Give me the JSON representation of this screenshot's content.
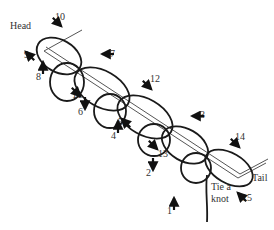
{
  "diagram": {
    "labels": {
      "head": "Head",
      "tail": "Tail",
      "tie_line1": "Tie a",
      "tie_line2": "knot"
    },
    "steps": [
      {
        "n": "1",
        "x": 167,
        "y": 214,
        "dir": "up"
      },
      {
        "n": "2",
        "x": 146,
        "y": 176,
        "dir": "down"
      },
      {
        "n": "3",
        "x": 200,
        "y": 118,
        "dir": "left"
      },
      {
        "n": "4",
        "x": 111,
        "y": 139,
        "dir": "up"
      },
      {
        "n": "5",
        "x": 118,
        "y": 125,
        "dir": "upleft"
      },
      {
        "n": "6",
        "x": 78,
        "y": 115,
        "dir": "down"
      },
      {
        "n": "7",
        "x": 110,
        "y": 57,
        "dir": "left"
      },
      {
        "n": "8",
        "x": 36,
        "y": 80,
        "dir": "up"
      },
      {
        "n": "9",
        "x": 24,
        "y": 58,
        "dir": "upleft"
      },
      {
        "n": "10",
        "x": 55,
        "y": 20,
        "dir": "downright"
      },
      {
        "n": "11",
        "x": 72,
        "y": 98,
        "dir": "downright"
      },
      {
        "n": "12",
        "x": 150,
        "y": 82,
        "dir": "downright"
      },
      {
        "n": "13",
        "x": 158,
        "y": 157,
        "dir": "downright"
      },
      {
        "n": "14",
        "x": 235,
        "y": 140,
        "dir": "downright"
      },
      {
        "n": "15",
        "x": 242,
        "y": 201,
        "dir": "upleft"
      }
    ],
    "colors": {
      "line": "#1a1a1a",
      "rod": "#555555",
      "text": "#333333"
    }
  }
}
